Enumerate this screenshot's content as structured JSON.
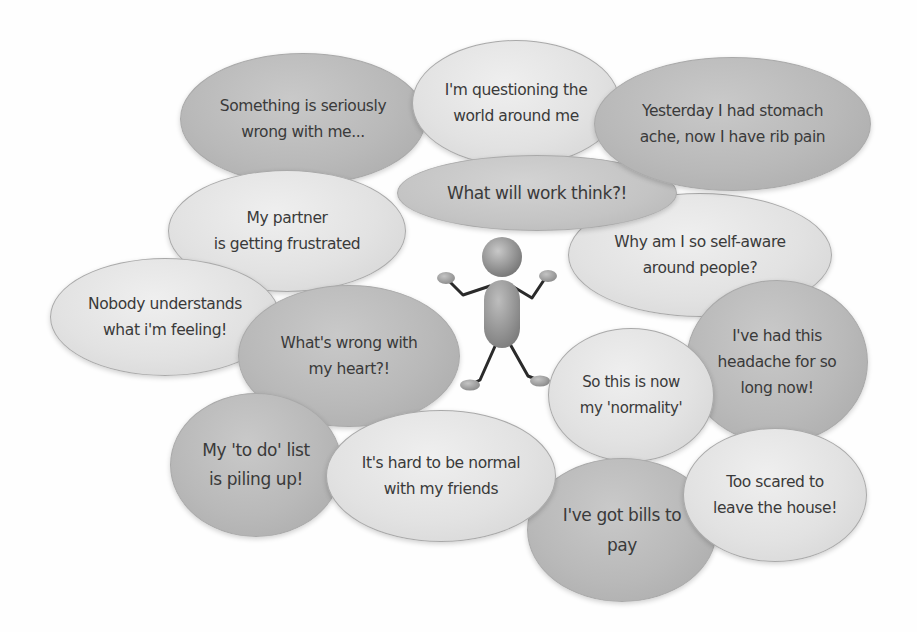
{
  "diagram": {
    "title": "",
    "central_figure": {
      "description": "shrugging stick figure",
      "icon": "shrugging-person-icon"
    },
    "bubbles": [
      {
        "id": "b1",
        "text": "Something is seriously\nwrong with me...",
        "shade": "dark"
      },
      {
        "id": "b2",
        "text": "I'm questioning the\nworld around me",
        "shade": "light"
      },
      {
        "id": "b3",
        "text": "Yesterday I had stomach\nache, now I have rib pain",
        "shade": "dark"
      },
      {
        "id": "b4",
        "text": "What will work think?!",
        "shade": "medium"
      },
      {
        "id": "b5",
        "text": "My partner\nis getting frustrated",
        "shade": "light"
      },
      {
        "id": "b6",
        "text": "Why am I so self-aware\naround people?",
        "shade": "light"
      },
      {
        "id": "b7",
        "text": "Nobody understands\nwhat i'm feeling!",
        "shade": "light"
      },
      {
        "id": "b8",
        "text": "What's wrong with\nmy heart?!",
        "shade": "dark"
      },
      {
        "id": "b9",
        "text": "I've had this\nheadache for so\nlong now!",
        "shade": "dark"
      },
      {
        "id": "b10",
        "text": "So this is now\nmy 'normality'",
        "shade": "light"
      },
      {
        "id": "b11",
        "text": "My 'to do' list\nis piling up!",
        "shade": "dark"
      },
      {
        "id": "b12",
        "text": "It's hard to be normal\nwith my friends",
        "shade": "light"
      },
      {
        "id": "b13",
        "text": "I've got bills to\npay",
        "shade": "dark"
      },
      {
        "id": "b14",
        "text": "Too scared to\nleave the house!",
        "shade": "light"
      }
    ]
  },
  "colors": {
    "background": "#ffffff",
    "bubble_dark": "#b9b9b9",
    "bubble_medium": "#c4c4c4",
    "bubble_light": "#e2e2e2",
    "bubble_border": "#a9a9a9",
    "text": "#3a3a3a",
    "figure_body": "#9a9a9a",
    "figure_limbs": "#2a2a2a"
  }
}
